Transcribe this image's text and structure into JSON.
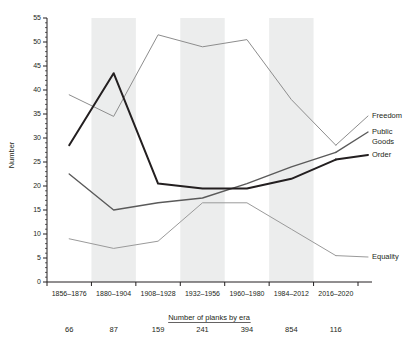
{
  "chart_data": {
    "type": "line",
    "title": "",
    "xlabel": "Number of planks by era",
    "ylabel": "Number",
    "ylim": [
      0,
      55
    ],
    "ytick_step": 5,
    "yticks": [
      0,
      5,
      10,
      15,
      20,
      25,
      30,
      35,
      40,
      45,
      50,
      55
    ],
    "grid": false,
    "legend_position": "right-inline",
    "categories": [
      "1856–1876",
      "1880–1904",
      "1908–1928",
      "1932–1956",
      "1960–1980",
      "1984–2012",
      "2016–2020"
    ],
    "plank_counts": [
      66,
      87,
      159,
      241,
      394,
      854,
      116
    ],
    "banded_categories": [
      "1880–1904",
      "1932–1956",
      "1984–2012"
    ],
    "series": [
      {
        "name": "Freedom",
        "color": "#8d8d8d",
        "width": 1.0,
        "values": [
          39,
          34.5,
          51.5,
          49,
          50.5,
          38,
          28.5
        ]
      },
      {
        "name": "Public Goods",
        "color": "#5a5a5a",
        "width": 1.4,
        "values": [
          22.5,
          15,
          16.5,
          17.5,
          20.5,
          24,
          27
        ]
      },
      {
        "name": "Order",
        "color": "#231f20",
        "width": 2.0,
        "values": [
          28.5,
          43.5,
          20.5,
          19.5,
          19.5,
          21.5,
          25.5
        ]
      },
      {
        "name": "Equality",
        "color": "#9a9a9a",
        "width": 1.0,
        "values": [
          9,
          7,
          8.5,
          16.5,
          16.5,
          11,
          5.5
        ]
      }
    ],
    "legend_entries": [
      {
        "label": "Freedom",
        "series": "Freedom"
      },
      {
        "label": "Public",
        "label2": "Goods",
        "series": "Public Goods"
      },
      {
        "label": "Order",
        "series": "Order"
      },
      {
        "label": "Equality",
        "series": "Equality"
      }
    ]
  }
}
